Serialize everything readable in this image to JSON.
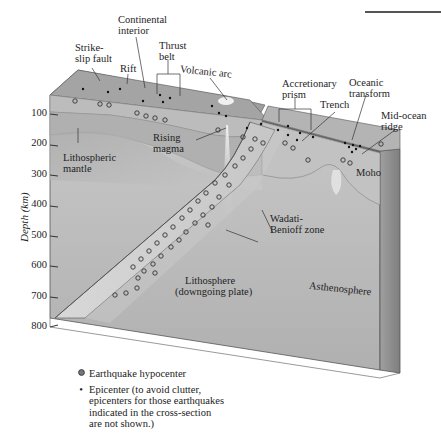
{
  "figure": {
    "type": "block-diagram"
  },
  "axis": {
    "title": "Depth (km)",
    "ticks": [
      "100",
      "200",
      "300",
      "400",
      "500",
      "600",
      "700",
      "800"
    ]
  },
  "labels": {
    "strike_slip_fault": [
      "Strike-",
      "slip fault"
    ],
    "rift": "Rift",
    "continental_interior": [
      "Continental",
      "interior"
    ],
    "thrust_belt": [
      "Thrust",
      "belt"
    ],
    "volcanic_arc": "Volcanic arc",
    "accretionary_prism": [
      "Accretionary",
      "prism"
    ],
    "trench": "Trench",
    "oceanic_transform": [
      "Oceanic",
      "transform"
    ],
    "mid_ocean_ridge": [
      "Mid-ocean",
      "ridge"
    ],
    "moho": "Moho",
    "rising_magma": [
      "Rising",
      "magma"
    ],
    "lithospheric_mantle": [
      "Lithospheric",
      "mantle"
    ],
    "wadati_benioff": [
      "Wadati-",
      "Benioff zone"
    ],
    "lithosphere": [
      "Lithosphere",
      "(downgoing plate)"
    ],
    "asthenosphere": "Asthenosphere"
  },
  "legend": {
    "hypocenter": "Earthquake hypocenter",
    "epicenter": [
      "Epicenter (to avoid clutter,",
      "epicenters for those earthquakes",
      "indicated in the cross-section",
      "are not shown.)"
    ]
  },
  "colors": {
    "top_surface": "#9a9a9a",
    "front_face": "#b8b8b8",
    "lithosphere_band": "#d6d6d6",
    "asthenosphere": "#c4c4c4",
    "right_face": "#8e8e8e",
    "outline": "#444444"
  }
}
